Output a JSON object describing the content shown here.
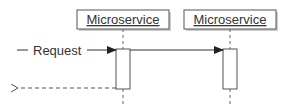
{
  "diagram": {
    "type": "sequence",
    "colors": {
      "stroke": "#555555",
      "text": "#333333",
      "box_fill": "#ffffff",
      "shadow": "#cccccc"
    },
    "participants": [
      {
        "id": "p1",
        "label": "Microservice"
      },
      {
        "id": "p2",
        "label": "Microservice"
      }
    ],
    "messages": [
      {
        "from": "external",
        "to": "p1",
        "label": "Request",
        "style": "solid",
        "arrow": "filled"
      },
      {
        "from": "p1",
        "to": "p2",
        "label": "",
        "style": "solid",
        "arrow": "filled"
      },
      {
        "from": "p1",
        "to": "external",
        "label": "",
        "style": "dashed",
        "arrow": "open"
      }
    ]
  }
}
